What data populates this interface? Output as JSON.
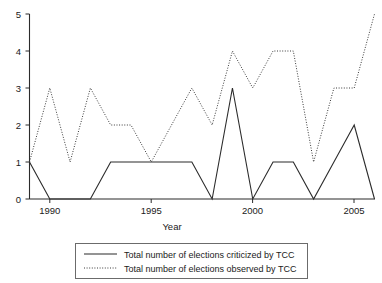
{
  "chart_data": {
    "type": "line",
    "title": "",
    "xlabel": "Year",
    "ylabel": "",
    "xlim": [
      1989,
      2006
    ],
    "ylim": [
      0,
      5
    ],
    "grid": false,
    "legend_position": "bottom",
    "x": [
      1989,
      1990,
      1991,
      1992,
      1993,
      1994,
      1995,
      1996,
      1997,
      1998,
      1999,
      2000,
      2001,
      2002,
      2003,
      2004,
      2005,
      2006
    ],
    "xticks": [
      1990,
      1995,
      2000,
      2005
    ],
    "xtick_labels": [
      "1990",
      "1995",
      "2000",
      "2005"
    ],
    "yticks": [
      0,
      1,
      2,
      3,
      4,
      5
    ],
    "ytick_labels": [
      "0",
      "1",
      "2",
      "3",
      "4",
      "5"
    ],
    "series": [
      {
        "name": "Total number of elections criticized by TCC",
        "style": "solid",
        "color": "#2b2b2b",
        "values": [
          1,
          0,
          0,
          0,
          1,
          1,
          1,
          1,
          1,
          0,
          3,
          0,
          1,
          1,
          0,
          1,
          2,
          0
        ]
      },
      {
        "name": "Total number of elections observed by TCC",
        "style": "dotted",
        "color": "#3a3a3a",
        "values": [
          1,
          3,
          1,
          3,
          2,
          2,
          1,
          2,
          3,
          2,
          4,
          3,
          4,
          4,
          1,
          3,
          3,
          5
        ]
      }
    ]
  },
  "legend": {
    "entries": [
      {
        "label": "Total number of elections criticized by TCC",
        "style": "solid"
      },
      {
        "label": "Total number of elections observed by TCC",
        "style": "dotted"
      }
    ]
  },
  "axes": {
    "x_title": "Year"
  }
}
